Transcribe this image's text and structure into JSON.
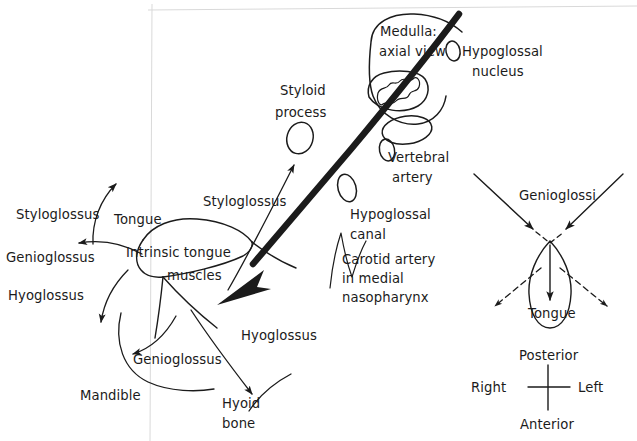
{
  "figure": {
    "type": "anatomical-diagram",
    "background_color": "#ffffff",
    "ink_color": "#1b1b1b",
    "scan_edge_color": "#d8d8d8"
  },
  "labels": {
    "medulla_line1": "Medulla:",
    "medulla_line2": "axial view",
    "hypoglossal_nucleus_line1": "Hypoglossal",
    "hypoglossal_nucleus_line2": "nucleus",
    "vertebral_artery_line1": "Vertebral",
    "vertebral_artery_line2": "artery",
    "hypoglossal_canal_line1": "Hypoglossal",
    "hypoglossal_canal_line2": "canal",
    "carotid_line1": "Carotid artery",
    "carotid_line2": "in medial",
    "carotid_line3": "nasopharynx",
    "styloid_process_line1": "Styloid",
    "styloid_process_line2": "process",
    "styloglossus_right": "Styloglossus",
    "styloglossus_left": "Styloglossus",
    "genioglossus_left": "Genioglossus",
    "hyoglossus_left": "Hyoglossus",
    "tongue": "Tongue",
    "intrinsic_line1": "Intrinsic tongue",
    "intrinsic_line2": "muscles",
    "genioglossus_bottom": "Genioglossus",
    "hyoglossus_right": "Hyoglossus",
    "mandible": "Mandible",
    "hyoid_line1": "Hyoid",
    "hyoid_line2": "bone",
    "genioglossi": "Genioglossi",
    "tongue_inset": "Tongue"
  },
  "orientation_key": {
    "top": "Posterior",
    "bottom": "Anterior",
    "left": "Right",
    "right": "Left"
  },
  "structures": [
    {
      "name": "medulla",
      "shape": "rounded-blob-with-squiggle"
    },
    {
      "name": "hypoglossal-nucleus",
      "shape": "small-oval"
    },
    {
      "name": "vertebral-artery",
      "shape": "small-oval"
    },
    {
      "name": "hypoglossal-canal",
      "shape": "small-oval"
    },
    {
      "name": "inferior-olive",
      "shape": "oval"
    },
    {
      "name": "styloid-process",
      "shape": "small-oval"
    },
    {
      "name": "intrinsic-tongue-muscles",
      "shape": "tongue-outline"
    },
    {
      "name": "hypoglossal-nerve",
      "shape": "thick-curved-arrow"
    }
  ]
}
